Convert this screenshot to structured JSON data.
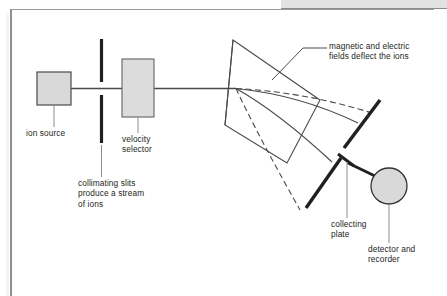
{
  "figure": {
    "background_color": "#ffffff",
    "ink_color": "#231f20",
    "fill_gray": "#d9d9d9",
    "band_color": "#e2e2e2",
    "frame_color": "#8f8f8f"
  },
  "labels": {
    "ion_source": "ion source",
    "velocity_selector": "velocity\nselector",
    "collimating_slits": "collimating slits\nproduce a stream\nof ions",
    "fields": "magnetic and electric\nfields deflect the ions",
    "collecting_plate": "collecting\nplate",
    "detector": "detector and\nrecorder"
  },
  "components": {
    "ion_source_box": {
      "name": "ion source",
      "fill": "#d9d9d9",
      "stroke": "#4a4a4a"
    },
    "velocity_selector_box": {
      "name": "velocity selector",
      "fill": "#dcdcdc",
      "stroke": "#6f6f6f"
    },
    "collimating_slit_upper": {
      "name": "upper collimating slit",
      "color": "#231f20"
    },
    "collimating_slit_lower": {
      "name": "lower collimating slit",
      "color": "#231f20"
    },
    "field_region": {
      "name": "field region plane",
      "fill": "none",
      "stroke": "#4a4a4a"
    },
    "collecting_plate_upper": {
      "name": "upper collecting plate",
      "color": "#231f20"
    },
    "collecting_plate_lower": {
      "name": "lower collecting plate",
      "color": "#231f20"
    },
    "detector_circle": {
      "name": "detector and recorder",
      "fill": "#d9d9d9",
      "stroke": "#333333"
    },
    "ion_beam": {
      "name": "ion beam",
      "color": "#4a4a4a"
    },
    "trajectories": {
      "solid_count": 2,
      "dashed_count": 2,
      "color": "#4a4a4a"
    }
  }
}
